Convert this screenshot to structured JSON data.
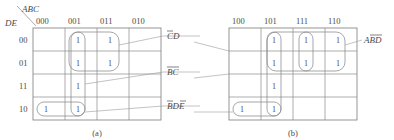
{
  "figure": {
    "type": "karnaugh-map-pair",
    "row_variable_label": "DE",
    "col_variable_label": "ABC",
    "row_headers": [
      "00",
      "01",
      "11",
      "10"
    ],
    "maps": [
      {
        "id": "a",
        "caption": "(a)",
        "col_headers": [
          "000",
          "001",
          "011",
          "010"
        ],
        "cells": [
          [
            "",
            "1",
            "1",
            ""
          ],
          [
            "",
            "1",
            "1",
            ""
          ],
          [
            "",
            "1",
            "",
            ""
          ],
          [
            "1",
            "1",
            "",
            ""
          ]
        ],
        "group_labels": [
          {
            "text": "CD",
            "overbar": "C"
          },
          {
            "text": "BC",
            "overbar": "BC"
          },
          {
            "text": "BDE",
            "overbar": "B,E"
          }
        ]
      },
      {
        "id": "b",
        "caption": "(b)",
        "col_headers": [
          "100",
          "101",
          "111",
          "110"
        ],
        "cells": [
          [
            "",
            "1",
            "1",
            "1"
          ],
          [
            "",
            "1",
            "1",
            "1"
          ],
          [
            "",
            "1",
            "",
            ""
          ],
          [
            "1",
            "1",
            "",
            ""
          ]
        ],
        "group_labels": [
          {
            "text": "ABD",
            "overbar": "BD"
          }
        ]
      }
    ],
    "labels": {
      "corner_top": "ABC",
      "corner_bottom": "DE",
      "term_cd": "CD",
      "term_bc": "BC",
      "term_bde": "BDE",
      "term_abd": "ABD",
      "caption_a": "(a)",
      "caption_b": "(b)",
      "one": "1"
    },
    "colors": {
      "grid": "#8a8a8a",
      "text": "#4a4a4a",
      "background": "#ffffff",
      "group": "#8a8a8a",
      "leader": "#9a9a9a"
    }
  }
}
